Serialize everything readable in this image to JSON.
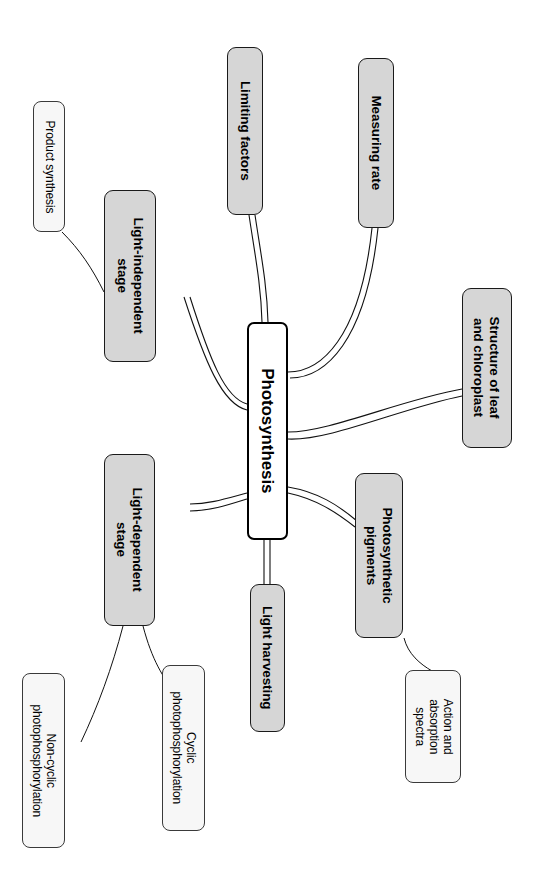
{
  "diagram": {
    "type": "mind-map",
    "topic": "Photosynthesis",
    "orientation": "rotated-90-clockwise",
    "colors": {
      "branch_fill": "#d6d6d6",
      "leaf_fill": "#f7f7f7",
      "stroke": "#000000",
      "background": "#ffffff"
    }
  },
  "central": {
    "label": "Photosynthesis"
  },
  "branches": [
    {
      "id": "limiting-factors",
      "label": "Limiting factors"
    },
    {
      "id": "measuring-rate",
      "label": "Measuring rate"
    },
    {
      "id": "structure-leaf",
      "label": "Structure of leaf\nand chloroplast"
    },
    {
      "id": "photosynthetic-pigments",
      "label": "Photosynthetic\npigments"
    },
    {
      "id": "light-harvesting",
      "label": "Light harvesting"
    },
    {
      "id": "light-dependent",
      "label": "Light-dependent\nstage"
    },
    {
      "id": "light-independent",
      "label": "Light-independent\nstage"
    }
  ],
  "leaves": [
    {
      "id": "product-synthesis",
      "label": "Product synthesis"
    },
    {
      "id": "non-cyclic",
      "label": "Non-cyclic\nphotophosphorylation"
    },
    {
      "id": "cyclic",
      "label": "Cyclic\nphotophosphorylation"
    },
    {
      "id": "action-absorption",
      "label": "Action and\nabsorption\nspectra"
    }
  ],
  "links": [
    {
      "from": "Photosynthesis",
      "to": "Limiting factors"
    },
    {
      "from": "Photosynthesis",
      "to": "Measuring rate"
    },
    {
      "from": "Photosynthesis",
      "to": "Structure of leaf and chloroplast"
    },
    {
      "from": "Photosynthesis",
      "to": "Photosynthetic pigments"
    },
    {
      "from": "Photosynthesis",
      "to": "Light harvesting"
    },
    {
      "from": "Photosynthesis",
      "to": "Light-dependent stage"
    },
    {
      "from": "Photosynthesis",
      "to": "Light-independent stage"
    },
    {
      "from": "Light-independent stage",
      "to": "Product synthesis"
    },
    {
      "from": "Light-dependent stage",
      "to": "Non-cyclic photophosphorylation"
    },
    {
      "from": "Light-dependent stage",
      "to": "Cyclic photophosphorylation"
    },
    {
      "from": "Photosynthetic pigments",
      "to": "Action and absorption spectra"
    }
  ]
}
